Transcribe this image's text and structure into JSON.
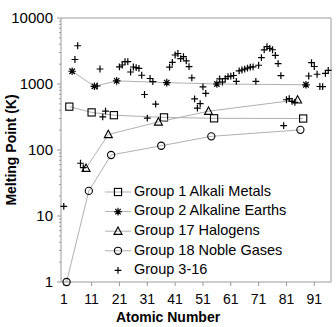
{
  "chart_data": {
    "type": "scatter",
    "title": "",
    "xlabel": "Atomic Number",
    "ylabel": "Melting Point (K)",
    "yscale": "log",
    "ylim": [
      1,
      10000
    ],
    "xlim": [
      0,
      97
    ],
    "ytick_labels": [
      "10000",
      "1000",
      "100",
      "10",
      "1"
    ],
    "ytick_values": [
      10000,
      1000,
      100,
      10,
      1
    ],
    "xtick_labels": [
      "1",
      "11",
      "21",
      "31",
      "41",
      "51",
      "61",
      "71",
      "81",
      "91"
    ],
    "xtick_values": [
      1,
      11,
      21,
      31,
      41,
      51,
      61,
      71,
      81,
      91
    ],
    "grid": false,
    "legend_position": "inside-lower-left",
    "series": [
      {
        "name": "Group 1 Alkali Metals",
        "marker": "square",
        "connected": true,
        "x": [
          3,
          11,
          19,
          37,
          55,
          87
        ],
        "y": [
          454,
          371,
          337,
          312,
          302,
          300
        ]
      },
      {
        "name": "Group 2 Alkaline Earths",
        "marker": "asterisk",
        "connected": true,
        "x": [
          4,
          12,
          20,
          38,
          56,
          88
        ],
        "y": [
          1560,
          923,
          1115,
          1050,
          1000,
          973
        ]
      },
      {
        "name": "Group 17 Halogens",
        "marker": "triangle",
        "connected": true,
        "x": [
          9,
          17,
          35,
          53,
          85
        ],
        "y": [
          53,
          172,
          266,
          387,
          575
        ]
      },
      {
        "name": "Group 18 Noble Gases",
        "marker": "circle",
        "connected": true,
        "x": [
          2,
          10,
          18,
          36,
          54,
          86
        ],
        "y": [
          1,
          24,
          84,
          116,
          161,
          202
        ]
      },
      {
        "name": "Group 3-16",
        "marker": "plus",
        "connected": false,
        "x": [
          1,
          5,
          6,
          7,
          8,
          13,
          14,
          15,
          16,
          21,
          22,
          23,
          24,
          25,
          26,
          27,
          28,
          29,
          30,
          31,
          32,
          33,
          34,
          39,
          40,
          41,
          42,
          43,
          44,
          45,
          46,
          47,
          48,
          49,
          50,
          51,
          52,
          57,
          58,
          59,
          60,
          61,
          62,
          63,
          64,
          65,
          66,
          67,
          68,
          69,
          70,
          71,
          72,
          73,
          74,
          75,
          76,
          77,
          78,
          79,
          80,
          81,
          82,
          83,
          84,
          89,
          90,
          91,
          92,
          93,
          94,
          95,
          96
        ],
        "y": [
          14,
          2349,
          3800,
          63,
          54,
          933,
          1687,
          317,
          388,
          1814,
          1941,
          2183,
          2180,
          1519,
          1811,
          1768,
          1728,
          1358,
          693,
          303,
          1211,
          1090,
          494,
          1799,
          2128,
          2750,
          2896,
          2430,
          2607,
          2237,
          1828,
          1235,
          594,
          430,
          505,
          904,
          723,
          1193,
          1068,
          1208,
          1297,
          1315,
          1345,
          1099,
          1585,
          1629,
          1680,
          1734,
          1802,
          1818,
          1097,
          1925,
          2506,
          3290,
          3695,
          3459,
          3306,
          2719,
          2041,
          1337,
          234,
          577,
          600,
          544,
          527,
          1323,
          2115,
          1841,
          1405,
          917,
          913,
          1449,
          1613
        ]
      }
    ]
  },
  "legend": {
    "entries": [
      {
        "label": "Group 1 Alkali Metals",
        "marker": "square"
      },
      {
        "label": "Group 2 Alkaline Earths",
        "marker": "asterisk"
      },
      {
        "label": "Group 17 Halogens",
        "marker": "triangle"
      },
      {
        "label": "Group 18 Noble Gases",
        "marker": "circle"
      },
      {
        "label": "Group 3-16",
        "marker": "plus"
      }
    ]
  },
  "colors": {
    "marker_stroke": "#000000",
    "line_stroke": "#b0b0b0",
    "axis_stroke": "#9a9a9a",
    "background": "#ffffff",
    "text": "#000000"
  }
}
